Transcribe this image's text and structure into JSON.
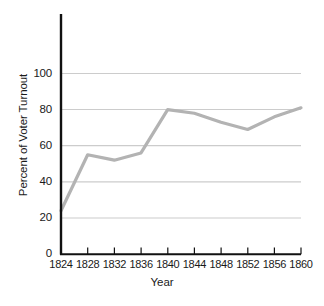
{
  "chart_data": {
    "type": "line",
    "title": "",
    "xlabel": "Year",
    "ylabel": "Percent of Voter Turnout",
    "x": [
      1824,
      1828,
      1832,
      1836,
      1840,
      1844,
      1848,
      1852,
      1856,
      1860
    ],
    "categories": [
      "1824",
      "1828",
      "1832",
      "1836",
      "1840",
      "1844",
      "1848",
      "1852",
      "1856",
      "1860"
    ],
    "values": [
      24,
      55,
      52,
      56,
      80,
      78,
      73,
      69,
      76,
      81
    ],
    "series": [
      {
        "name": "Percent of Voter Turnout",
        "values": [
          24,
          55,
          52,
          56,
          80,
          78,
          73,
          69,
          76,
          81
        ],
        "color": "#b3b3b3"
      }
    ],
    "xlim": [
      1824,
      1860
    ],
    "ylim": [
      0,
      100
    ],
    "y_ticks": [
      0,
      20,
      40,
      60,
      80,
      100
    ],
    "y_tick_labels": [
      "0",
      "20",
      "40",
      "60",
      "80",
      "100"
    ],
    "x_ticks": [
      1824,
      1828,
      1832,
      1836,
      1840,
      1844,
      1848,
      1852,
      1856,
      1860
    ],
    "grid": true,
    "grid_axis": "y",
    "legend": false,
    "legend_position": "none",
    "colors": {
      "line": "#b3b3b3",
      "gridline": "#cccccc",
      "axis": "#111111",
      "text": "#1a1a1a",
      "background": "#ffffff"
    }
  },
  "axes": {
    "y_title": "Percent of Voter Turnout",
    "x_title": "Year",
    "y_labels": [
      "100",
      "80",
      "60",
      "40",
      "20",
      "0"
    ],
    "x_labels": [
      "1824",
      "1828",
      "1832",
      "1836",
      "1840",
      "1844",
      "1848",
      "1852",
      "1856",
      "1860"
    ]
  }
}
